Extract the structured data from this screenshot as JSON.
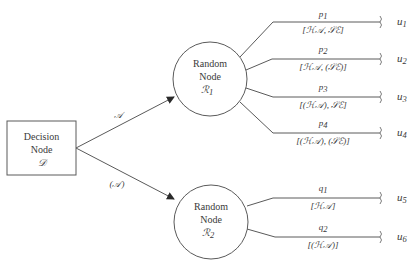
{
  "diagram": {
    "type": "decision-tree",
    "colors": {
      "line": "#5a5a5a",
      "text": "#3a3a3a",
      "background": "#ffffff"
    },
    "decision_node": {
      "line1": "Decision",
      "line2": "Node",
      "symbol": "𝒟"
    },
    "edges_from_decision": [
      {
        "label": "𝒜",
        "to": "R1"
      },
      {
        "label": "(𝒜)",
        "to": "R2"
      }
    ],
    "random_nodes": [
      {
        "id": "R1",
        "line1": "Random",
        "line2": "Node",
        "symbol": "ℛ",
        "subscript": "1"
      },
      {
        "id": "R2",
        "line1": "Random",
        "line2": "Node",
        "symbol": "ℛ",
        "subscript": "2"
      }
    ],
    "branches": [
      {
        "prob": "p",
        "prob_sub": "1",
        "state": "[ℋ𝒜, 𝒮ℰ]",
        "utility": "u",
        "utility_sub": "1"
      },
      {
        "prob": "p",
        "prob_sub": "2",
        "state": "[ℋ𝒜, (𝒮ℰ)]",
        "utility": "u",
        "utility_sub": "2"
      },
      {
        "prob": "p",
        "prob_sub": "3",
        "state": "[(ℋ𝒜), 𝒮ℰ]",
        "utility": "u",
        "utility_sub": "3"
      },
      {
        "prob": "p",
        "prob_sub": "4",
        "state": "[(ℋ𝒜), (𝒮ℰ)]",
        "utility": "u",
        "utility_sub": "4"
      },
      {
        "prob": "q",
        "prob_sub": "1",
        "state": "[ℋ𝒜]",
        "utility": "u",
        "utility_sub": "5"
      },
      {
        "prob": "q",
        "prob_sub": "2",
        "state": "[(ℋ𝒜)]",
        "utility": "u",
        "utility_sub": "6"
      }
    ]
  }
}
